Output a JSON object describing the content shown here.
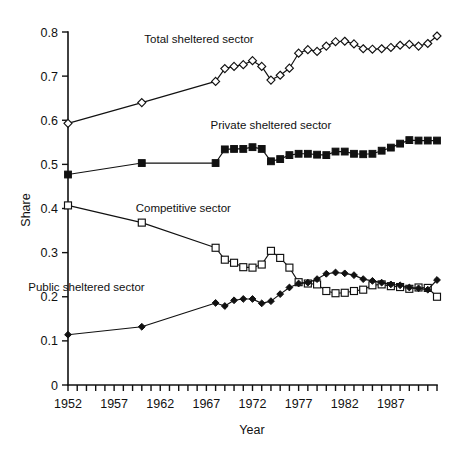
{
  "chart_data": {
    "type": "line",
    "title": "",
    "xlabel": "Year",
    "ylabel": "Share",
    "xlim": [
      1952,
      1992
    ],
    "ylim": [
      0,
      0.8
    ],
    "grid": false,
    "legend_position": "inline-annotations",
    "x_tick_labels": [
      "1952",
      "1957",
      "1962",
      "1967",
      "1972",
      "1977",
      "1982",
      "1987"
    ],
    "x_tick_values": [
      1952,
      1957,
      1962,
      1967,
      1972,
      1977,
      1982,
      1987
    ],
    "x_minor_tick_step": 1,
    "y_tick_labels": [
      "0",
      "0.1",
      "0.2",
      "0.3",
      "0.4",
      "0.5",
      "0.6",
      "0.7",
      "0.8"
    ],
    "y_tick_values": [
      0,
      0.1,
      0.2,
      0.3,
      0.4,
      0.5,
      0.6,
      0.7,
      0.8
    ],
    "series": [
      {
        "name": "Total sheltered sector",
        "marker": "open-diamond",
        "label_text": "Total sheltered sector",
        "x": [
          1952,
          1960,
          1968,
          1969,
          1970,
          1971,
          1972,
          1973,
          1974,
          1975,
          1976,
          1977,
          1978,
          1979,
          1980,
          1981,
          1982,
          1983,
          1984,
          1985,
          1986,
          1987,
          1988,
          1989,
          1990,
          1991,
          1992
        ],
        "values": [
          0.593,
          0.64,
          0.688,
          0.717,
          0.722,
          0.726,
          0.735,
          0.722,
          0.691,
          0.702,
          0.718,
          0.752,
          0.76,
          0.756,
          0.768,
          0.778,
          0.779,
          0.773,
          0.762,
          0.761,
          0.762,
          0.765,
          0.77,
          0.772,
          0.768,
          0.774,
          0.791
        ]
      },
      {
        "name": "Private sheltered sector",
        "marker": "solid-square",
        "label_text": "Private sheltered sector",
        "x": [
          1952,
          1960,
          1968,
          1969,
          1970,
          1971,
          1972,
          1973,
          1974,
          1975,
          1976,
          1977,
          1978,
          1979,
          1980,
          1981,
          1982,
          1983,
          1984,
          1985,
          1986,
          1987,
          1988,
          1989,
          1990,
          1991,
          1992
        ],
        "values": [
          0.477,
          0.503,
          0.503,
          0.534,
          0.535,
          0.535,
          0.539,
          0.535,
          0.507,
          0.512,
          0.521,
          0.524,
          0.524,
          0.522,
          0.521,
          0.529,
          0.529,
          0.524,
          0.523,
          0.524,
          0.531,
          0.538,
          0.547,
          0.555,
          0.554,
          0.554,
          0.554
        ]
      },
      {
        "name": "Competitive sector",
        "marker": "open-square",
        "label_text": "Competitive sector",
        "x": [
          1952,
          1960,
          1968,
          1969,
          1970,
          1971,
          1972,
          1973,
          1974,
          1975,
          1976,
          1977,
          1978,
          1979,
          1980,
          1981,
          1982,
          1983,
          1984,
          1985,
          1986,
          1987,
          1988,
          1989,
          1990,
          1991,
          1992
        ],
        "values": [
          0.407,
          0.368,
          0.311,
          0.284,
          0.277,
          0.267,
          0.266,
          0.273,
          0.304,
          0.288,
          0.266,
          0.233,
          0.23,
          0.228,
          0.213,
          0.208,
          0.209,
          0.213,
          0.216,
          0.226,
          0.228,
          0.224,
          0.222,
          0.218,
          0.221,
          0.22,
          0.2
        ]
      },
      {
        "name": "Public sheltered sector",
        "marker": "solid-diamond",
        "label_text": "Public sheltered sector",
        "x": [
          1952,
          1960,
          1968,
          1969,
          1970,
          1971,
          1972,
          1973,
          1974,
          1975,
          1976,
          1977,
          1978,
          1979,
          1980,
          1981,
          1982,
          1983,
          1984,
          1985,
          1986,
          1987,
          1988,
          1989,
          1990,
          1991,
          1992
        ],
        "values": [
          0.114,
          0.132,
          0.186,
          0.179,
          0.192,
          0.195,
          0.195,
          0.185,
          0.19,
          0.206,
          0.221,
          0.23,
          0.232,
          0.24,
          0.252,
          0.255,
          0.253,
          0.249,
          0.24,
          0.236,
          0.232,
          0.228,
          0.226,
          0.221,
          0.219,
          0.216,
          0.238
        ]
      }
    ],
    "annotations": [
      {
        "text": "Total sheltered sector",
        "x": 1966.2,
        "y": 0.775
      },
      {
        "text": "Private sheltered sector",
        "x": 1974.0,
        "y": 0.58
      },
      {
        "text": "Competitive sector",
        "x": 1964.5,
        "y": 0.393
      },
      {
        "text": "Public sheltered sector",
        "x": 1954.0,
        "y": 0.212
      }
    ]
  },
  "colors": {
    "ink": "#111111",
    "background": "#ffffff",
    "marker_fill_open": "#ffffff",
    "marker_fill_solid": "#111111"
  }
}
